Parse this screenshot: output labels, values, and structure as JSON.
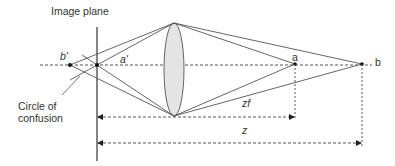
{
  "diagram": {
    "type": "optics-depth-of-field",
    "labels": {
      "image_plane": "Image plane",
      "b_prime": "b'",
      "a_prime": "a'",
      "a": "a",
      "b": "b",
      "circle_line1": "Circle of",
      "circle_line2": "confusion",
      "zf": "zf",
      "z": "z"
    },
    "colors": {
      "line": "#444444",
      "lens_fill": "#e4e4e4",
      "text": "#333333"
    }
  }
}
